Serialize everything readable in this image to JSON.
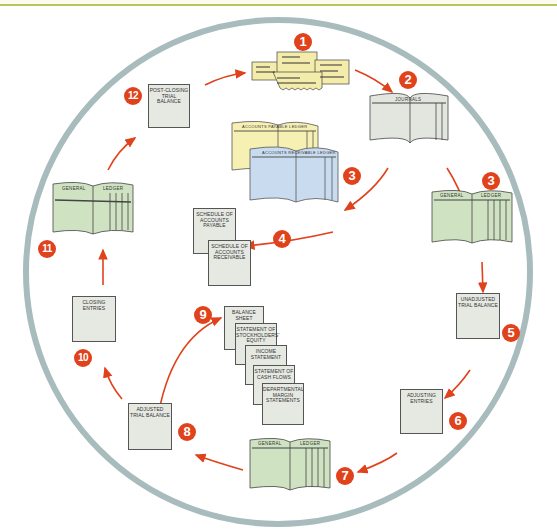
{
  "diagram": {
    "type": "accounting-cycle",
    "colors": {
      "ring": "#a8bcbd",
      "arrow": "#e0421c",
      "badge": "#e0421c",
      "ledger_green": "#cfe3c2",
      "source_yellow": "#f4ecaa",
      "payable_yellow": "#f7f0b3",
      "receivable_blue": "#c9dcef",
      "report_gray": "#e6e8e2",
      "top_rule": "#b6c65a"
    },
    "steps": [
      {
        "number": "1",
        "label": "Source documents"
      },
      {
        "number": "2",
        "label": "JOURNALS"
      },
      {
        "number": "3",
        "label": "GENERAL LEDGER"
      },
      {
        "number": "3",
        "label": "ACCOUNTS RECEIVABLE LEDGER / ACCOUNTS PAYABLE LEDGER"
      },
      {
        "number": "4",
        "label": "SCHEDULE OF ACCOUNTS PAYABLE / SCHEDULE OF ACCOUNTS RECEIVABLE"
      },
      {
        "number": "5",
        "label": "UNADJUSTED TRIAL BALANCE"
      },
      {
        "number": "6",
        "label": "ADJUSTING ENTRIES"
      },
      {
        "number": "7",
        "label": "GENERAL LEDGER"
      },
      {
        "number": "8",
        "label": "ADJUSTED TRIAL BALANCE"
      },
      {
        "number": "9",
        "label": "Financial statements"
      },
      {
        "number": "10",
        "label": "CLOSING ENTRIES"
      },
      {
        "number": "11",
        "label": "GENERAL LEDGER"
      },
      {
        "number": "12",
        "label": "POST-CLOSING TRIAL BALANCE"
      }
    ],
    "labels": {
      "journals": "JOURNALS",
      "general": "GENERAL",
      "ledger": "LEDGER",
      "ap_ledger": "ACCOUNTS PAYABLE LEDGER",
      "ar_ledger": "ACCOUNTS RECEIVABLE LEDGER",
      "schedule_ap": "SCHEDULE OF ACCOUNTS PAYABLE",
      "schedule_ar": "SCHEDULE OF ACCOUNTS RECEIVABLE",
      "unadjusted_tb": "UNADJUSTED TRIAL BALANCE",
      "adjusting_entries": "ADJUSTING ENTRIES",
      "adjusted_tb": "ADJUSTED TRIAL BALANCE",
      "closing_entries": "CLOSING ENTRIES",
      "post_closing_tb": "POST-CLOSING TRIAL BALANCE",
      "balance_sheet": "BALANCE SHEET",
      "stockholders_equity": "STATEMENT OF STOCKHOLDERS' EQUITY",
      "income_statement": "INCOME STATEMENT",
      "cash_flows": "STATEMENT OF CASH FLOWS",
      "departmental_margin": "DEPARTMENTAL MARGIN STATEMENTS"
    },
    "badges": {
      "b1": "1",
      "b2": "2",
      "b3a": "3",
      "b3b": "3",
      "b4": "4",
      "b5": "5",
      "b6": "6",
      "b7": "7",
      "b8": "8",
      "b9": "9",
      "b10": "10",
      "b11": "11",
      "b12": "12"
    }
  }
}
